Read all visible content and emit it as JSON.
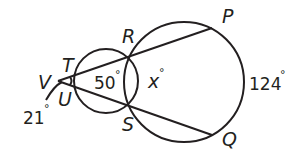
{
  "diagram": {
    "type": "two intersecting circles with two secants from external point",
    "colors": {
      "stroke": "#231f20",
      "background": "#ffffff"
    },
    "points": {
      "V": {
        "label": "V"
      },
      "T": {
        "label": "T"
      },
      "U": {
        "label": "U"
      },
      "R": {
        "label": "R"
      },
      "S": {
        "label": "S"
      },
      "P": {
        "label": "P"
      },
      "Q": {
        "label": "Q"
      }
    },
    "measures": {
      "arc_TU": {
        "value": "21",
        "unit": "°"
      },
      "arc_RS_small": {
        "value": "50",
        "unit": "°"
      },
      "arc_RS_large": {
        "value": "x",
        "unit": "°"
      },
      "arc_PQ": {
        "value": "124",
        "unit": "°"
      }
    }
  }
}
